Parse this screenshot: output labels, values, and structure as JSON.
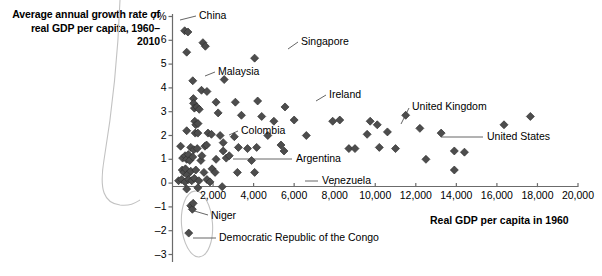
{
  "chart_data": {
    "type": "scatter",
    "title": "",
    "ylabel": "Average annual growth rate of real GDP per capita, 1960–2010",
    "xlabel": "Real GDP per capita in 1960",
    "xlim": [
      0,
      20000
    ],
    "ylim": [
      -3,
      7
    ],
    "grid": false,
    "legend": null,
    "x_ticks": [
      2000,
      4000,
      6000,
      8000,
      10000,
      12000,
      14000,
      16000,
      18000,
      20000
    ],
    "x_tick_labels": [
      "2,000",
      "4,000",
      "6,000",
      "8,000",
      "10,000",
      "12,000",
      "14,000",
      "16,000",
      "18,000",
      "20,000"
    ],
    "y_ticks": [
      -3,
      -2,
      -1,
      0,
      1,
      2,
      3,
      4,
      5,
      6,
      7
    ],
    "y_tick_labels": [
      "–3",
      "–2",
      "–1",
      "0",
      "1",
      "2",
      "3",
      "4",
      "5",
      "6",
      "7%"
    ],
    "marker": "diamond",
    "marker_color": "#4d4d4d",
    "points": [
      {
        "x": 600,
        "y": 6.4,
        "label": "China"
      },
      {
        "x": 760,
        "y": 6.35,
        "label": ""
      },
      {
        "x": 1500,
        "y": 5.9,
        "label": ""
      },
      {
        "x": 1620,
        "y": 5.75,
        "label": ""
      },
      {
        "x": 700,
        "y": 5.5,
        "label": ""
      },
      {
        "x": 4050,
        "y": 5.25,
        "label": "Singapore"
      },
      {
        "x": 2550,
        "y": 4.35,
        "label": ""
      },
      {
        "x": 1000,
        "y": 4.3,
        "label": ""
      },
      {
        "x": 1430,
        "y": 3.9,
        "label": "Malaysia"
      },
      {
        "x": 1700,
        "y": 3.85,
        "label": ""
      },
      {
        "x": 1030,
        "y": 3.55,
        "label": ""
      },
      {
        "x": 1040,
        "y": 3.35,
        "label": ""
      },
      {
        "x": 2150,
        "y": 3.4,
        "label": ""
      },
      {
        "x": 3100,
        "y": 3.4,
        "label": ""
      },
      {
        "x": 4200,
        "y": 3.45,
        "label": ""
      },
      {
        "x": 1080,
        "y": 3.15,
        "label": ""
      },
      {
        "x": 1200,
        "y": 3.2,
        "label": ""
      },
      {
        "x": 1320,
        "y": 3.1,
        "label": ""
      },
      {
        "x": 5550,
        "y": 3.2,
        "label": "Ireland"
      },
      {
        "x": 2250,
        "y": 2.95,
        "label": ""
      },
      {
        "x": 3400,
        "y": 2.85,
        "label": ""
      },
      {
        "x": 4400,
        "y": 2.8,
        "label": ""
      },
      {
        "x": 1100,
        "y": 2.6,
        "label": ""
      },
      {
        "x": 1150,
        "y": 2.45,
        "label": ""
      },
      {
        "x": 1260,
        "y": 2.5,
        "label": ""
      },
      {
        "x": 5000,
        "y": 2.6,
        "label": ""
      },
      {
        "x": 6000,
        "y": 2.65,
        "label": ""
      },
      {
        "x": 7900,
        "y": 2.6,
        "label": ""
      },
      {
        "x": 8250,
        "y": 2.65,
        "label": ""
      },
      {
        "x": 9750,
        "y": 2.6,
        "label": ""
      },
      {
        "x": 10100,
        "y": 2.45,
        "label": ""
      },
      {
        "x": 11500,
        "y": 2.85,
        "label": "United Kingdom"
      },
      {
        "x": 700,
        "y": 2.2,
        "label": ""
      },
      {
        "x": 1120,
        "y": 2.1,
        "label": ""
      },
      {
        "x": 1250,
        "y": 2.1,
        "label": ""
      },
      {
        "x": 1750,
        "y": 2.1,
        "label": ""
      },
      {
        "x": 1920,
        "y": 2.05,
        "label": ""
      },
      {
        "x": 2350,
        "y": 2.0,
        "label": ""
      },
      {
        "x": 3050,
        "y": 1.95,
        "label": ""
      },
      {
        "x": 4700,
        "y": 2.0,
        "label": ""
      },
      {
        "x": 6600,
        "y": 2.0,
        "label": ""
      },
      {
        "x": 9600,
        "y": 2.05,
        "label": ""
      },
      {
        "x": 10600,
        "y": 2.15,
        "label": ""
      },
      {
        "x": 12200,
        "y": 2.3,
        "label": ""
      },
      {
        "x": 16350,
        "y": 2.45,
        "label": ""
      },
      {
        "x": 17650,
        "y": 2.8,
        "label": ""
      },
      {
        "x": 13250,
        "y": 2.1,
        "label": "United States"
      },
      {
        "x": 400,
        "y": 1.55,
        "label": ""
      },
      {
        "x": 900,
        "y": 1.5,
        "label": ""
      },
      {
        "x": 1050,
        "y": 1.4,
        "label": ""
      },
      {
        "x": 1220,
        "y": 1.45,
        "label": ""
      },
      {
        "x": 1600,
        "y": 1.55,
        "label": ""
      },
      {
        "x": 1680,
        "y": 1.6,
        "label": ""
      },
      {
        "x": 2500,
        "y": 1.7,
        "label": "Colombia"
      },
      {
        "x": 2500,
        "y": 1.35,
        "label": ""
      },
      {
        "x": 3250,
        "y": 1.5,
        "label": ""
      },
      {
        "x": 3700,
        "y": 1.45,
        "label": ""
      },
      {
        "x": 4150,
        "y": 1.5,
        "label": ""
      },
      {
        "x": 5350,
        "y": 1.6,
        "label": ""
      },
      {
        "x": 5500,
        "y": 1.35,
        "label": ""
      },
      {
        "x": 8700,
        "y": 1.45,
        "label": ""
      },
      {
        "x": 9000,
        "y": 1.45,
        "label": ""
      },
      {
        "x": 10200,
        "y": 1.5,
        "label": ""
      },
      {
        "x": 11000,
        "y": 1.45,
        "label": ""
      },
      {
        "x": 13900,
        "y": 1.35,
        "label": ""
      },
      {
        "x": 14400,
        "y": 1.3,
        "label": ""
      },
      {
        "x": 500,
        "y": 1.05,
        "label": ""
      },
      {
        "x": 620,
        "y": 1.15,
        "label": ""
      },
      {
        "x": 700,
        "y": 1.0,
        "label": ""
      },
      {
        "x": 780,
        "y": 1.2,
        "label": ""
      },
      {
        "x": 850,
        "y": 0.95,
        "label": ""
      },
      {
        "x": 1000,
        "y": 1.1,
        "label": ""
      },
      {
        "x": 1400,
        "y": 0.95,
        "label": ""
      },
      {
        "x": 1450,
        "y": 1.15,
        "label": ""
      },
      {
        "x": 2150,
        "y": 1.0,
        "label": ""
      },
      {
        "x": 2650,
        "y": 1.05,
        "label": ""
      },
      {
        "x": 3900,
        "y": 0.95,
        "label": ""
      },
      {
        "x": 12500,
        "y": 1.0,
        "label": ""
      },
      {
        "x": 2800,
        "y": 1.15,
        "label": "Argentina"
      },
      {
        "x": 480,
        "y": 0.55,
        "label": ""
      },
      {
        "x": 560,
        "y": 0.45,
        "label": ""
      },
      {
        "x": 640,
        "y": 0.6,
        "label": ""
      },
      {
        "x": 720,
        "y": 0.35,
        "label": ""
      },
      {
        "x": 900,
        "y": 0.5,
        "label": ""
      },
      {
        "x": 1150,
        "y": 0.55,
        "label": ""
      },
      {
        "x": 1550,
        "y": 0.45,
        "label": ""
      },
      {
        "x": 1950,
        "y": 0.6,
        "label": ""
      },
      {
        "x": 2100,
        "y": 0.45,
        "label": ""
      },
      {
        "x": 13900,
        "y": 0.55,
        "label": ""
      },
      {
        "x": 300,
        "y": 0.1,
        "label": ""
      },
      {
        "x": 450,
        "y": 0.15,
        "label": ""
      },
      {
        "x": 620,
        "y": 0.05,
        "label": ""
      },
      {
        "x": 800,
        "y": 0.15,
        "label": ""
      },
      {
        "x": 950,
        "y": 0.1,
        "label": ""
      },
      {
        "x": 1080,
        "y": 0.2,
        "label": ""
      },
      {
        "x": 1300,
        "y": 0.1,
        "label": ""
      },
      {
        "x": 1700,
        "y": 0.15,
        "label": ""
      },
      {
        "x": 1850,
        "y": 0.05,
        "label": ""
      },
      {
        "x": 3200,
        "y": 0.45,
        "label": "Venezuela"
      },
      {
        "x": 4050,
        "y": 0.45,
        "label": ""
      },
      {
        "x": 700,
        "y": -0.25,
        "label": ""
      },
      {
        "x": 1250,
        "y": -0.2,
        "label": ""
      },
      {
        "x": 2450,
        "y": -0.15,
        "label": ""
      },
      {
        "x": 900,
        "y": -0.95,
        "label": "Niger"
      },
      {
        "x": 980,
        "y": -1.1,
        "label": ""
      },
      {
        "x": 1020,
        "y": -0.85,
        "label": ""
      },
      {
        "x": 800,
        "y": -2.1,
        "label": "Democratic Republic of the Congo"
      }
    ],
    "annotations": [
      {
        "name": "China",
        "text": "China"
      },
      {
        "name": "Singapore",
        "text": "Singapore"
      },
      {
        "name": "Malaysia",
        "text": "Malaysia"
      },
      {
        "name": "Ireland",
        "text": "Ireland"
      },
      {
        "name": "United Kingdom",
        "text": "United Kingdom"
      },
      {
        "name": "United States",
        "text": "United States"
      },
      {
        "name": "Colombia",
        "text": "Colombia"
      },
      {
        "name": "Argentina",
        "text": "Argentina"
      },
      {
        "name": "Venezuela",
        "text": "Venezuela"
      },
      {
        "name": "Niger",
        "text": "Niger"
      },
      {
        "name": "DRC",
        "text": "Democratic Republic of the Congo"
      }
    ],
    "highlight_ellipse": {
      "description": "oval enclosing negative-growth countries",
      "cx": 800,
      "cy": -1.5
    }
  },
  "axis_titles": {
    "y": "Average annual growth rate of real GDP per capita, 1960–2010",
    "x": "Real GDP per capita in 1960"
  },
  "labels": {
    "china": "China",
    "singapore": "Singapore",
    "malaysia": "Malaysia",
    "ireland": "Ireland",
    "united_kingdom": "United Kingdom",
    "united_states": "United States",
    "colombia": "Colombia",
    "argentina": "Argentina",
    "venezuela": "Venezuela",
    "niger": "Niger",
    "drc": "Democratic Republic of the Congo"
  },
  "colors": {
    "marker": "#4d4d4d",
    "axis": "#6b6b6b",
    "text": "#000000",
    "annotation_line": "#8a8a8a",
    "ellipse": "#b8b8b8"
  }
}
